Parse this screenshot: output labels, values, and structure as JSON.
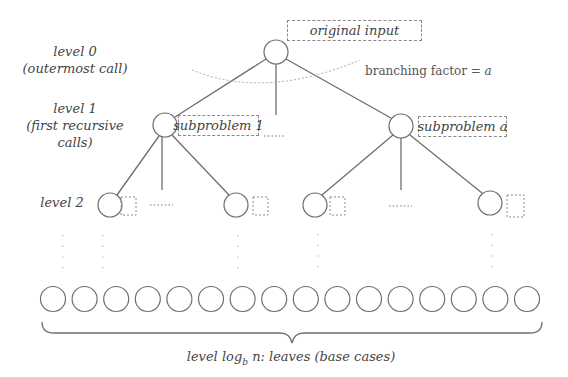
{
  "diagram": {
    "colors": {
      "stroke": "#6e6e6e",
      "dashed": "#8a8a8a",
      "dotted": "#aaaaaa",
      "text": "#444444"
    },
    "level_labels": [
      {
        "line1": "level 0",
        "line2": "(outermost call)",
        "line3": ""
      },
      {
        "line1": "level 1",
        "line2": "(first recursive",
        "line3": "calls)"
      },
      {
        "line1": "level 2",
        "line2": "",
        "line3": ""
      }
    ],
    "root": {
      "box_label": "original input"
    },
    "level1": [
      {
        "box_label": "subproblem 1"
      },
      {
        "box_label": "subproblem a"
      }
    ],
    "branching_annotation": {
      "text": "branching factor =",
      "variable": "a"
    },
    "level2_dots": "......",
    "leaf_count": 16,
    "leaves_label": {
      "prefix": "level log",
      "subscript": "b",
      "suffix": " n: leaves (base cases)"
    }
  }
}
